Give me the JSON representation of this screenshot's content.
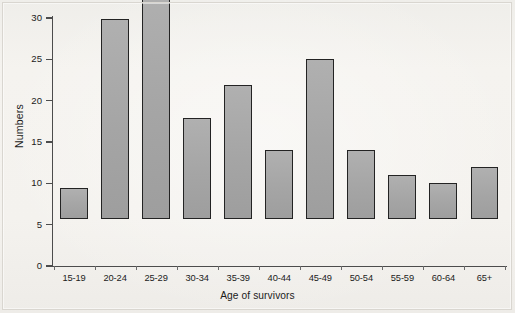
{
  "chart_data": {
    "type": "bar",
    "title": "",
    "xlabel": "Age of survivors",
    "ylabel": "Numbers",
    "categories": [
      "15-19",
      "20-24",
      "25-29",
      "30-34",
      "35-39",
      "40-44",
      "45-49",
      "50-54",
      "55-59",
      "60-64",
      "65+"
    ],
    "values": [
      3.8,
      24.2,
      28.2,
      12.2,
      16.2,
      8.3,
      19.3,
      8.4,
      5.3,
      4.4,
      6.3
    ],
    "ylim": [
      0,
      30
    ],
    "yticks": [
      0,
      5,
      10,
      15,
      20,
      25,
      30
    ],
    "ytick_labels": [
      "0",
      "5",
      "10",
      "15",
      "20",
      "25",
      "30"
    ],
    "grid": false,
    "legend": false,
    "bar_fill": "#a9a9a9",
    "bar_edge": "#232323",
    "background": "#f3f1ed"
  },
  "axis": {
    "y_title": "Numbers",
    "x_title": "Age of survivors"
  }
}
